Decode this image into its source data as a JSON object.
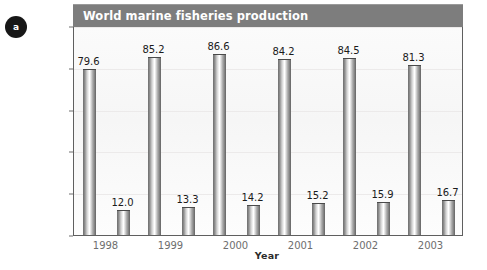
{
  "badge": {
    "label": "a"
  },
  "header": {
    "title": "World marine fisheries production"
  },
  "axes": {
    "y_ticks": [
      "0",
      "20",
      "40",
      "60",
      "80",
      "100"
    ],
    "x_ticks": [
      "1998",
      "1999",
      "2000",
      "2001",
      "2002",
      "2003"
    ],
    "ylabel": "Million tons",
    "xlabel": "Year"
  },
  "chart_data": {
    "type": "bar",
    "title": "World marine fisheries production",
    "xlabel": "Year",
    "ylabel": "Million tons",
    "ylim": [
      0,
      100
    ],
    "yticks": [
      0,
      20,
      40,
      60,
      80,
      100
    ],
    "grid": true,
    "legend": "none",
    "categories": [
      "1998",
      "1999",
      "2000",
      "2001",
      "2002",
      "2003"
    ],
    "series": [
      {
        "name": "series-1",
        "values": [
          79.6,
          85.2,
          86.6,
          84.2,
          84.5,
          81.3
        ],
        "labels": [
          "79.6",
          "85.2",
          "86.6",
          "84.2",
          "84.5",
          "81.3"
        ]
      },
      {
        "name": "series-2",
        "values": [
          12.0,
          13.3,
          14.2,
          15.2,
          15.9,
          16.7
        ],
        "labels": [
          "12.0",
          "13.3",
          "14.2",
          "15.2",
          "15.9",
          "16.7"
        ]
      }
    ],
    "colors": {
      "bar": "#8f8f8f",
      "header": "#7d7d7d",
      "text": "#1b1b1b",
      "tick": "#6e6e6e"
    }
  }
}
